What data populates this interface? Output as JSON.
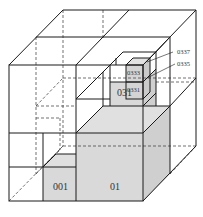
{
  "diagram": {
    "type": "octree-subdivision-cube",
    "colors": {
      "line": "#1a1a1a",
      "dashed": "#333333",
      "shade": "#d9d9d9",
      "shade_dark": "#c8c8c8",
      "background": "#ffffff"
    },
    "labels": {
      "cell_001": "001",
      "cell_01": "01",
      "cell_031": "031",
      "cell_0331": "0331",
      "cell_0333": "0333",
      "callout_0337": "0337",
      "callout_0335": "0335"
    }
  }
}
